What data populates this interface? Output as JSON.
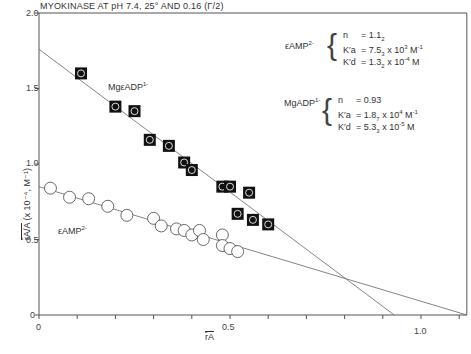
{
  "chart_data": {
    "type": "scatter",
    "title": "MYOKINASE AT pH 7.4, 25° AND 0.16 (Γ/2)",
    "xlabel": "r̄A",
    "ylabel": "r̄A/A (x 10^-4, M^-1)",
    "xlim": [
      0,
      1.12
    ],
    "ylim": [
      0,
      2.0
    ],
    "x_ticks": [
      "0",
      "0.5",
      "1.0"
    ],
    "y_ticks": [
      "0",
      "0.5",
      "1.0",
      "1.5",
      "2.0"
    ],
    "grid": false,
    "series": [
      {
        "name": "MgεADP1-",
        "marker": "filled-square-with-ring",
        "points": [
          [
            0.11,
            1.6
          ],
          [
            0.2,
            1.38
          ],
          [
            0.25,
            1.35
          ],
          [
            0.29,
            1.16
          ],
          [
            0.34,
            1.12
          ],
          [
            0.38,
            1.01
          ],
          [
            0.4,
            0.96
          ],
          [
            0.48,
            0.85
          ],
          [
            0.5,
            0.85
          ],
          [
            0.55,
            0.81
          ],
          [
            0.52,
            0.67
          ],
          [
            0.56,
            0.63
          ],
          [
            0.6,
            0.6
          ]
        ],
        "fit_line": [
          [
            0,
            1.76
          ],
          [
            0.93,
            0
          ]
        ]
      },
      {
        "name": "εAMP2-",
        "marker": "open-circle",
        "points": [
          [
            0.03,
            0.84
          ],
          [
            0.08,
            0.78
          ],
          [
            0.13,
            0.77
          ],
          [
            0.18,
            0.72
          ],
          [
            0.23,
            0.66
          ],
          [
            0.3,
            0.64
          ],
          [
            0.32,
            0.59
          ],
          [
            0.36,
            0.57
          ],
          [
            0.38,
            0.56
          ],
          [
            0.4,
            0.53
          ],
          [
            0.42,
            0.56
          ],
          [
            0.43,
            0.5
          ],
          [
            0.48,
            0.53
          ],
          [
            0.48,
            0.46
          ],
          [
            0.5,
            0.44
          ],
          [
            0.52,
            0.42
          ]
        ],
        "fit_line": [
          [
            0,
            0.85
          ],
          [
            1.12,
            0
          ]
        ]
      }
    ],
    "annotations": [
      {
        "label": "εAMP2-",
        "n": "= 1.12",
        "Ka": "= 7.53 x 10^3 M^-1",
        "Kd": "= 1.32 x 10^-4 M"
      },
      {
        "label": "MgADP1-",
        "n": "= 0.93",
        "Ka": "= 1.87 x 10^4 M^-1",
        "Kd": "= 5.33 x 10^-5 M"
      }
    ]
  },
  "text": {
    "title": "MYOKINASE AT pH 7.4, 25° AND 0.16 (Γ/2)",
    "series1_label": "MgεADP",
    "series1_sup": "1-",
    "series2_label": "εAMP",
    "series2_sup": "2-",
    "y_axis_label": "(x 10⁻⁴, M⁻¹)",
    "x_axis_label": "r̄A",
    "ann1": {
      "species": "εAMP",
      "charge": "2-",
      "n_lbl": "n",
      "n_val": "= 1.1",
      "n_sub": "2",
      "ka_lbl": "K′a",
      "ka_val": "= 7.5",
      "ka_sub": "3",
      "ka_rest": " x 10",
      "ka_exp": "3",
      "ka_unit": " M",
      "ka_uexp": "-1",
      "kd_lbl": "K′d",
      "kd_val": "= 1.3",
      "kd_sub": "2",
      "kd_rest": " x 10",
      "kd_exp": "-4",
      "kd_unit": " M"
    },
    "ann2": {
      "species": "MgADP",
      "charge": "1-",
      "n_lbl": "n",
      "n_val": "= 0.93",
      "ka_lbl": "K′a",
      "ka_val": "= 1.8",
      "ka_sub": "7",
      "ka_rest": " x 10",
      "ka_exp": "4",
      "ka_unit": " M",
      "ka_uexp": "-1",
      "kd_lbl": "K′d",
      "kd_val": "= 5.3",
      "kd_sub": "3",
      "kd_rest": " x 10",
      "kd_exp": "-5",
      "kd_unit": " M"
    }
  }
}
